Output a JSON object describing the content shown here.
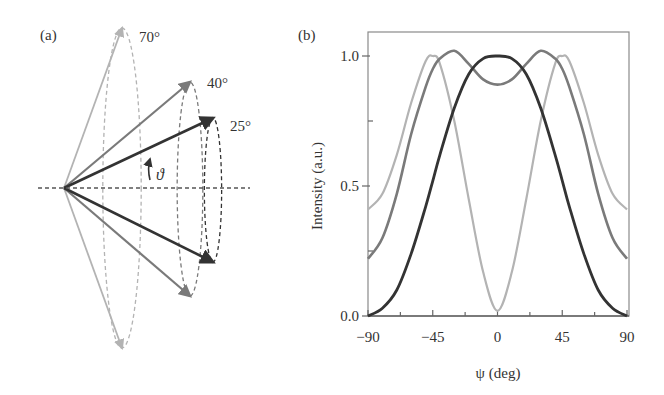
{
  "panel_a": {
    "label": "(a)",
    "theta_symbol": "ϑ",
    "origin": [
      64,
      188
    ],
    "cones": [
      {
        "angle_label": "70°",
        "angle": 70,
        "color": "#b3b3b3",
        "tip_top": [
          122,
          28
        ],
        "tip_bottom": [
          122,
          348
        ],
        "label_pos": [
          139,
          42
        ]
      },
      {
        "angle_label": "40°",
        "angle": 40,
        "color": "#7a7a7a",
        "tip_top": [
          190,
          82
        ],
        "tip_bottom": [
          190,
          296
        ],
        "label_pos": [
          207,
          88
        ]
      },
      {
        "angle_label": "25°",
        "angle": 25,
        "color": "#333333",
        "tip_top": [
          213,
          118
        ],
        "tip_bottom": [
          213,
          262
        ],
        "label_pos": [
          230,
          131
        ]
      }
    ]
  },
  "panel_b": {
    "label": "(b)",
    "frame": {
      "left": 368,
      "right": 629,
      "top": 32,
      "bottom": 316
    }
  },
  "chart_data": {
    "type": "line",
    "title": "",
    "xlabel": "ψ (deg)",
    "ylabel": "Intensity (a.u.)",
    "xlim": [
      -90,
      90
    ],
    "ylim": [
      0.0,
      1.08
    ],
    "xticks": [
      -90,
      -45,
      0,
      45,
      90
    ],
    "xtick_labels": [
      "−90",
      "−45",
      "0",
      "45",
      "90"
    ],
    "yticks": [
      0.0,
      0.5,
      1.0
    ],
    "ytick_labels": [
      "0.0",
      "0.5",
      "1.0"
    ],
    "grid": false,
    "legend": "none (curves correspond to cone angles 25°, 40°, 70° in panel a)",
    "x": [
      -90,
      -80,
      -70,
      -60,
      -50,
      -45,
      -40,
      -30,
      -20,
      -10,
      0,
      10,
      20,
      30,
      40,
      45,
      50,
      60,
      70,
      80,
      90
    ],
    "series": [
      {
        "name": "70°",
        "color": "#b3b3b3",
        "values": [
          0.41,
          0.47,
          0.62,
          0.82,
          0.98,
          1.0,
          0.97,
          0.75,
          0.45,
          0.17,
          0.02,
          0.17,
          0.45,
          0.75,
          0.97,
          1.0,
          0.98,
          0.82,
          0.62,
          0.47,
          0.41
        ]
      },
      {
        "name": "40°",
        "color": "#7a7a7a",
        "values": [
          0.22,
          0.3,
          0.47,
          0.7,
          0.88,
          0.95,
          0.99,
          1.02,
          0.97,
          0.91,
          0.89,
          0.91,
          0.97,
          1.02,
          0.99,
          0.95,
          0.88,
          0.7,
          0.47,
          0.3,
          0.22
        ]
      },
      {
        "name": "25°",
        "color": "#333333",
        "values": [
          0.0,
          0.03,
          0.1,
          0.24,
          0.42,
          0.52,
          0.62,
          0.8,
          0.93,
          0.99,
          1.0,
          0.99,
          0.93,
          0.8,
          0.62,
          0.52,
          0.42,
          0.24,
          0.1,
          0.03,
          0.0
        ]
      }
    ]
  }
}
